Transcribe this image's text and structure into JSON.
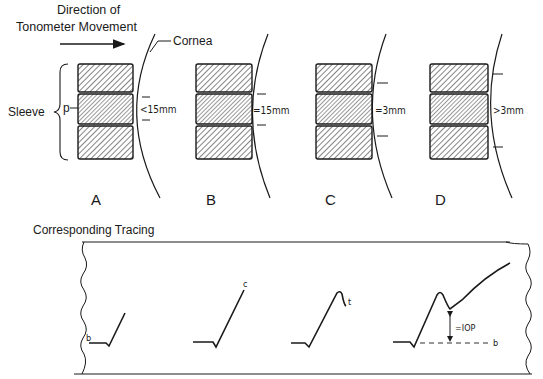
{
  "title": {
    "line1": "Direction of",
    "line2": "Tonometer Movement"
  },
  "labels": {
    "cornea": "Cornea",
    "sleeve": "Sleeve",
    "probe": "p",
    "tracing_heading": "Corresponding Tracing"
  },
  "panels": [
    {
      "letter": "A",
      "measurement": "<1.5mm",
      "measurement_display": "<15mm"
    },
    {
      "letter": "B",
      "measurement": "=1.5mm",
      "measurement_display": "=15mm"
    },
    {
      "letter": "C",
      "measurement": "=3mm",
      "measurement_display": "=3mm"
    },
    {
      "letter": "D",
      "measurement": ">3mm",
      "measurement_display": ">3mm"
    }
  ],
  "tracings": [
    {
      "panel": "A",
      "label": "b"
    },
    {
      "panel": "B",
      "label": "c"
    },
    {
      "panel": "C",
      "label": "t"
    },
    {
      "panel": "D",
      "label": "b",
      "annotation": "=IOP",
      "annotation_display": "=IOP"
    }
  ],
  "colors": {
    "ink": "#1a1a1a",
    "background": "#ffffff"
  }
}
